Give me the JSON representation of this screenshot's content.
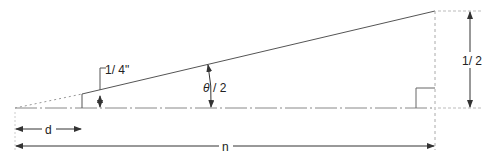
{
  "diagram": {
    "title": "",
    "labels": {
      "quarter_inch": "1/ 4\"",
      "half_angle_theta": "θ",
      "half_angle_rest": "/ 2",
      "half": "1/ 2",
      "d": "d",
      "n": "n"
    },
    "colors": {
      "line": "#555555",
      "text": "#222222",
      "dotted": "#999999",
      "background": "#ffffff"
    }
  }
}
